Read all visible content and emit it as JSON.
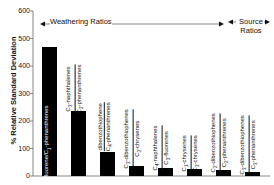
{
  "chart_data": {
    "type": "bar",
    "title": "",
    "xlabel": "",
    "ylabel": "% Relative Standard Deviation",
    "ylim": [
      0,
      600
    ],
    "yticks": [
      0,
      100,
      200,
      300,
      400,
      500,
      600
    ],
    "grid": false,
    "categories": [
      "fluorene/C1-phenanthrenes",
      "C3-naphthalenes/C2-phenanthrenes",
      "dibenzothiophene/C4-phenanthrenes",
      "C3-dibenzothiophenes/C3-chrysenes",
      "C4-naphthalenes/C3-fluorenes",
      "C1-chrysenes/C3-chrysenes",
      "C2-dibenzothiophenes/C2-phenanthrenes",
      "C3-dibenzothiophenes/C3-phenanthrenes"
    ],
    "values": [
      470,
      235,
      87,
      36,
      29,
      25,
      22,
      15
    ],
    "annotations": [
      {
        "text": "Weathering Ratios",
        "spans_bars": [
          1,
          6
        ],
        "arrow": "left-right"
      },
      {
        "text": "Source Ratios",
        "spans_bars": [
          7,
          8
        ],
        "arrow": "left-right"
      }
    ]
  },
  "labels": {
    "ylabel": "% Relative Standard Deviation",
    "weathering": "Weathering Ratios",
    "source_1": "Source",
    "source_2": "Ratios",
    "ticks": [
      "0",
      "100",
      "200",
      "300",
      "400",
      "500",
      "600"
    ],
    "bars": [
      {
        "num": "fluorene/C",
        "num_sub": "1",
        "num_tail": "-phenanthrenes",
        "single": true
      },
      {
        "num": "C",
        "num_sub": "3",
        "num_tail": "-naphthalenes",
        "den": "C",
        "den_sub": "2",
        "den_tail": "-phenanthrenes"
      },
      {
        "num": "dibenzothiophene",
        "num_sub": "",
        "num_tail": "",
        "den": "C",
        "den_sub": "4",
        "den_tail": "-phenanthrenes"
      },
      {
        "num": "C",
        "num_sub": "3",
        "num_tail": "-dibenzothiophenes",
        "den": "C",
        "den_sub": "3",
        "den_tail": "-chrysenes"
      },
      {
        "num": "C",
        "num_sub": "4",
        "num_tail": "-naphthalenes",
        "den": "C",
        "den_sub": "3",
        "den_tail": "-fluorenes"
      },
      {
        "num": "C",
        "num_sub": "1",
        "num_tail": "-chrysenes",
        "den": "C",
        "den_sub": "3",
        "den_tail": "-chrysenes"
      },
      {
        "num": "C",
        "num_sub": "2",
        "num_tail": "-dibenzothiophenes",
        "den": "C",
        "den_sub": "2",
        "den_tail": "-phenanthrenes"
      },
      {
        "num": "C",
        "num_sub": "3",
        "num_tail": "-dibenzothiophenes",
        "den": "C",
        "den_sub": "3",
        "den_tail": "-phenanthrenes"
      }
    ]
  },
  "colors": {
    "bar": "#000000",
    "axis": "#555555",
    "text": "#111111"
  }
}
